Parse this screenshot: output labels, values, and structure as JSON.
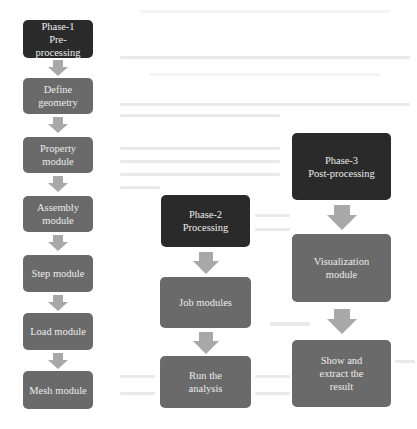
{
  "diagram": {
    "type": "flowchart",
    "colors": {
      "phase_box": "#2a2a2a",
      "module_box": "#6a6a6a",
      "arrow": "#a8a8a8",
      "box_text": "#ececec",
      "background": "#ffffff"
    },
    "columns": [
      {
        "phase": {
          "label": "Phase-1\nPre-processing"
        },
        "steps": [
          {
            "label": "Define\ngeometry"
          },
          {
            "label": "Property\nmodule"
          },
          {
            "label": "Assembly\nmodule"
          },
          {
            "label": "Step module"
          },
          {
            "label": "Load module"
          },
          {
            "label": "Mesh module"
          }
        ]
      },
      {
        "phase": {
          "label": "Phase-2\nProcessing"
        },
        "steps": [
          {
            "label": "Job modules"
          },
          {
            "label": "Run the\nanalysis"
          }
        ]
      },
      {
        "phase": {
          "label": "Phase-3\nPost-processing"
        },
        "steps": [
          {
            "label": "Visualization\nmodule"
          },
          {
            "label": "Show and\nextract the\nresult"
          }
        ]
      }
    ],
    "arrows": [
      {
        "from": "Phase-1 Pre-processing",
        "to": "Define geometry",
        "icon": "arrow-down-icon"
      },
      {
        "from": "Define geometry",
        "to": "Property module",
        "icon": "arrow-down-icon"
      },
      {
        "from": "Property module",
        "to": "Assembly module",
        "icon": "arrow-down-icon"
      },
      {
        "from": "Assembly module",
        "to": "Step module",
        "icon": "arrow-down-icon"
      },
      {
        "from": "Step module",
        "to": "Load module",
        "icon": "arrow-down-icon"
      },
      {
        "from": "Load module",
        "to": "Mesh module",
        "icon": "arrow-down-icon"
      },
      {
        "from": "Phase-2 Processing",
        "to": "Job modules",
        "icon": "arrow-down-icon"
      },
      {
        "from": "Job modules",
        "to": "Run the analysis",
        "icon": "arrow-down-icon"
      },
      {
        "from": "Phase-3 Post-processing",
        "to": "Visualization module",
        "icon": "arrow-down-icon"
      },
      {
        "from": "Visualization module",
        "to": "Show and extract the result",
        "icon": "arrow-down-icon"
      }
    ]
  }
}
